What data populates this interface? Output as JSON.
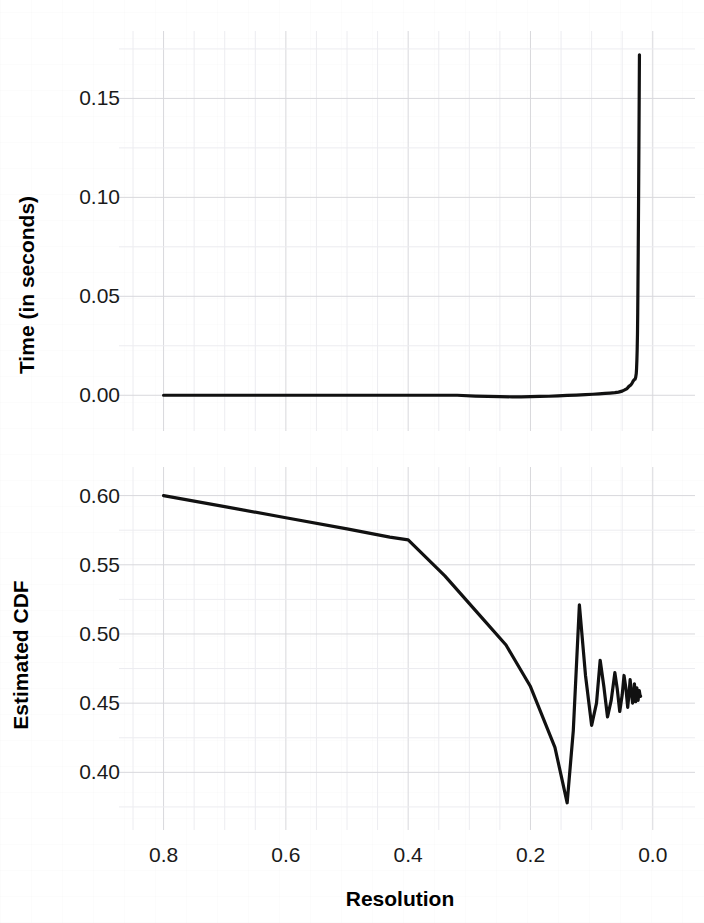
{
  "figure": {
    "title": "",
    "background_color": "#ffffff",
    "line_color": "#111111",
    "grid_major_color": "#d8d8dc",
    "grid_minor_color": "#ececf0"
  },
  "shared_axis": {
    "xlabel": "Resolution",
    "xticks": [
      "0.8",
      "0.6",
      "0.4",
      "0.2",
      "0.0"
    ],
    "xtick_values": [
      0.8,
      0.6,
      0.4,
      0.2,
      0.0
    ],
    "xlim": [
      0.85,
      -0.02
    ],
    "reversed": true
  },
  "panels": [
    {
      "name": "time-panel",
      "ylabel": "Time (in seconds)",
      "yticks": [
        "0.00",
        "0.05",
        "0.10",
        "0.15"
      ],
      "ytick_values": [
        0.0,
        0.05,
        0.1,
        0.15
      ]
    },
    {
      "name": "cdf-panel",
      "ylabel": "Estimated CDF",
      "yticks": [
        "0.40",
        "0.45",
        "0.50",
        "0.55",
        "0.60"
      ],
      "ytick_values": [
        0.4,
        0.45,
        0.5,
        0.55,
        0.6
      ]
    }
  ],
  "chart_data": [
    {
      "type": "line",
      "title": "Time (in seconds) vs Resolution",
      "xlabel": "Resolution",
      "ylabel": "Time (in seconds)",
      "xlim": [
        0.85,
        -0.02
      ],
      "ylim": [
        -0.012,
        0.178
      ],
      "xticks": [
        0.8,
        0.6,
        0.4,
        0.2,
        0.0
      ],
      "yticks": [
        0.0,
        0.05,
        0.1,
        0.15
      ],
      "grid": true,
      "legend": "none",
      "series": [
        {
          "name": "Time",
          "x": [
            0.8,
            0.76,
            0.72,
            0.68,
            0.64,
            0.6,
            0.56,
            0.52,
            0.48,
            0.44,
            0.4,
            0.36,
            0.32,
            0.29,
            0.27,
            0.25,
            0.23,
            0.215,
            0.2,
            0.185,
            0.17,
            0.155,
            0.14,
            0.125,
            0.11,
            0.098,
            0.088,
            0.078,
            0.07,
            0.062,
            0.056,
            0.05,
            0.046,
            0.042,
            0.039,
            0.036,
            0.034,
            0.032,
            0.03,
            0.029,
            0.028,
            0.027,
            0.0265,
            0.026,
            0.0255,
            0.025,
            0.0246,
            0.0242,
            0.0238,
            0.0234,
            0.023,
            0.0226,
            0.0222,
            0.0218
          ],
          "y": [
            0.0,
            0.0,
            0.0,
            0.0,
            0.0,
            0.0,
            0.0,
            0.0,
            0.0,
            0.0,
            0.0,
            0.0,
            0.0,
            -0.0004,
            -0.0006,
            -0.0007,
            -0.0008,
            -0.0008,
            -0.0007,
            -0.0006,
            -0.0005,
            -0.0003,
            -0.0001,
            0.0001,
            0.0003,
            0.0005,
            0.0007,
            0.0009,
            0.0011,
            0.0013,
            0.0016,
            0.0021,
            0.0027,
            0.0034,
            0.0045,
            0.0052,
            0.006,
            0.0072,
            0.008,
            0.0081,
            0.009,
            0.011,
            0.0135,
            0.0175,
            0.023,
            0.031,
            0.042,
            0.056,
            0.072,
            0.09,
            0.109,
            0.129,
            0.15,
            0.172
          ]
        }
      ]
    },
    {
      "type": "line",
      "title": "Estimated CDF vs Resolution",
      "xlabel": "Resolution",
      "ylabel": "Estimated CDF",
      "xlim": [
        0.85,
        -0.02
      ],
      "ylim": [
        0.367,
        0.612
      ],
      "xticks": [
        0.8,
        0.6,
        0.4,
        0.2,
        0.0
      ],
      "yticks": [
        0.4,
        0.45,
        0.5,
        0.55,
        0.6
      ],
      "grid": true,
      "legend": "none",
      "series": [
        {
          "name": "Estimated CDF",
          "x": [
            0.8,
            0.7,
            0.6,
            0.5,
            0.43,
            0.4,
            0.34,
            0.28,
            0.24,
            0.2,
            0.16,
            0.14,
            0.13,
            0.12,
            0.11,
            0.1,
            0.092,
            0.086,
            0.08,
            0.074,
            0.068,
            0.062,
            0.058,
            0.054,
            0.05,
            0.047,
            0.044,
            0.041,
            0.039,
            0.037,
            0.035,
            0.033,
            0.031,
            0.03,
            0.029,
            0.028,
            0.027,
            0.026,
            0.025,
            0.024,
            0.023,
            0.022,
            0.021,
            0.02
          ],
          "y": [
            0.6,
            0.592,
            0.584,
            0.576,
            0.57,
            0.568,
            0.542,
            0.512,
            0.492,
            0.462,
            0.418,
            0.378,
            0.43,
            0.521,
            0.47,
            0.434,
            0.45,
            0.481,
            0.462,
            0.44,
            0.452,
            0.472,
            0.46,
            0.444,
            0.456,
            0.47,
            0.461,
            0.447,
            0.456,
            0.467,
            0.458,
            0.45,
            0.457,
            0.464,
            0.457,
            0.451,
            0.456,
            0.461,
            0.456,
            0.452,
            0.456,
            0.459,
            0.456,
            0.455
          ]
        }
      ]
    }
  ]
}
